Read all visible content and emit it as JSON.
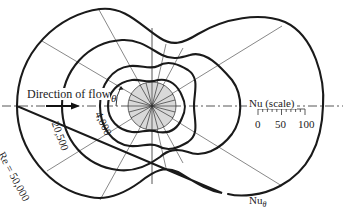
{
  "figure": {
    "flow_label": "Direction of flow",
    "angle_label": "θ",
    "curve_labels": {
      "re_50000": "Re = 50,000",
      "re_20500": "20,500",
      "re_4000": "4,000"
    },
    "scale": {
      "label": "Nu (scale)",
      "ticks": [
        "0",
        "50",
        "100"
      ]
    },
    "nu_theta_label": "Nu",
    "nu_theta_sub": "θ"
  },
  "colors": {
    "background": "#ffffff",
    "curve": "#1a1a1a",
    "cylinder_fill": "#d9d9d9",
    "lines": "#555555"
  }
}
